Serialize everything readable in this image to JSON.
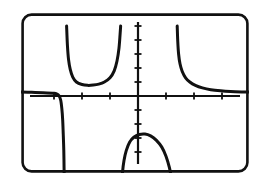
{
  "screen": {
    "kind": "graphing-calculator-screen",
    "width": 265,
    "height": 182,
    "background_color": "#ffffff",
    "frame": {
      "stroke_color": "#111111",
      "stroke_width": 2.6,
      "corner_radius": 9,
      "x": 21,
      "y": 13,
      "width": 228,
      "height": 160
    }
  },
  "chart_data": {
    "type": "line",
    "title": "",
    "subtitle": "",
    "xlabel": "",
    "ylabel": "",
    "grid": false,
    "legend": null,
    "axes": {
      "style": "calculator-axes-with-tick-marks",
      "color": "#111111",
      "stroke_width": 2.2,
      "tick_length": 7,
      "tick_width": 1.8,
      "origin_px": {
        "x": 117,
        "y": 83
      },
      "pixels_per_unit_x": 28,
      "pixels_per_unit_y": 14,
      "xlim": [
        -4.2,
        4.0
      ],
      "ylim": [
        -6.4,
        5.0
      ],
      "x_ticks": [
        -4,
        -3,
        -2,
        -1,
        1,
        2,
        3
      ],
      "y_ticks": [
        -6,
        -5,
        -4,
        -3,
        -2,
        -1,
        1,
        2,
        3,
        4,
        5
      ],
      "tick_labels_shown": false
    },
    "asymptotes": {
      "vertical": [
        -2.6,
        -0.6,
        1.35
      ],
      "note": "curve breaks at vertical asymptotes"
    },
    "branches": [
      {
        "name": "left-branch",
        "description": "enters from left just above x-axis, decreases slowly then plunges down to bottom of window near x = -2.6",
        "points": [
          [
            -4.18,
            0.28
          ],
          [
            -3.8,
            0.26
          ],
          [
            -3.4,
            0.24
          ],
          [
            -3.0,
            0.2
          ],
          [
            -2.9,
            0.14
          ],
          [
            -2.82,
            0.02
          ],
          [
            -2.76,
            -0.3
          ],
          [
            -2.72,
            -0.9
          ],
          [
            -2.69,
            -1.7
          ],
          [
            -2.67,
            -2.7
          ],
          [
            -2.65,
            -3.9
          ],
          [
            -2.64,
            -5.2
          ],
          [
            -2.63,
            -6.4
          ]
        ]
      },
      {
        "name": "upper-middle-u",
        "description": "U shaped branch above the x-axis between the first two vertical asymptotes, minimum near y = 0.75",
        "points": [
          [
            -2.55,
            5.0
          ],
          [
            -2.52,
            3.6
          ],
          [
            -2.48,
            2.6
          ],
          [
            -2.42,
            1.9
          ],
          [
            -2.33,
            1.35
          ],
          [
            -2.2,
            1.0
          ],
          [
            -2.0,
            0.82
          ],
          [
            -1.8,
            0.76
          ],
          [
            -1.6,
            0.78
          ],
          [
            -1.4,
            0.85
          ],
          [
            -1.2,
            1.0
          ],
          [
            -1.0,
            1.3
          ],
          [
            -0.85,
            1.8
          ],
          [
            -0.75,
            2.5
          ],
          [
            -0.68,
            3.4
          ],
          [
            -0.64,
            4.4
          ],
          [
            -0.62,
            5.0
          ]
        ]
      },
      {
        "name": "lower-middle-n",
        "description": "inverted-U branch below the x-axis between the second and third vertical asymptotes, maximum near y = -2.7",
        "points": [
          [
            -0.58,
            -6.4
          ],
          [
            -0.55,
            -5.4
          ],
          [
            -0.5,
            -4.6
          ],
          [
            -0.42,
            -3.9
          ],
          [
            -0.3,
            -3.3
          ],
          [
            -0.15,
            -2.95
          ],
          [
            0.05,
            -2.75
          ],
          [
            0.25,
            -2.72
          ],
          [
            0.45,
            -2.85
          ],
          [
            0.65,
            -3.15
          ],
          [
            0.85,
            -3.65
          ],
          [
            1.0,
            -4.3
          ],
          [
            1.12,
            -5.1
          ],
          [
            1.2,
            -5.9
          ],
          [
            1.25,
            -6.4
          ]
        ]
      },
      {
        "name": "right-branch",
        "description": "drops from top of window near x = 1.4 and flattens out toward the x-axis on the right",
        "points": [
          [
            1.4,
            5.0
          ],
          [
            1.42,
            3.9
          ],
          [
            1.45,
            3.0
          ],
          [
            1.5,
            2.3
          ],
          [
            1.58,
            1.75
          ],
          [
            1.7,
            1.3
          ],
          [
            1.85,
            1.0
          ],
          [
            2.05,
            0.76
          ],
          [
            2.3,
            0.58
          ],
          [
            2.6,
            0.45
          ],
          [
            2.95,
            0.37
          ],
          [
            3.3,
            0.32
          ],
          [
            3.7,
            0.29
          ],
          [
            3.98,
            0.28
          ]
        ]
      }
    ],
    "curve_style": {
      "color": "#111111",
      "stroke_width": 3.0,
      "linecap": "round"
    }
  }
}
